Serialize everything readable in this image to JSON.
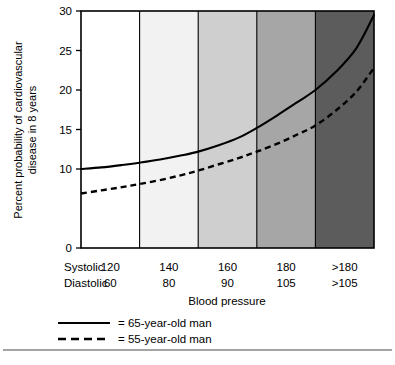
{
  "chart_data": {
    "type": "line",
    "title": "",
    "xlabel": "Blood pressure",
    "ylabel": "Percent probability of cardiovascular disease in 8 years",
    "ylabel_line1": "Percent probability of cardiovascular",
    "ylabel_line2": "disease in 8 years",
    "ylim": [
      0,
      30
    ],
    "yticks": [
      0,
      10,
      15,
      20,
      25,
      30
    ],
    "ytick_labels": [
      "0",
      "10",
      "15",
      "20",
      "25",
      "30"
    ],
    "grid": false,
    "legend_position": "below-axes",
    "x_axis_rows": [
      {
        "name": "Systolic",
        "values": [
          "120",
          "140",
          "160",
          "180",
          ">180"
        ]
      },
      {
        "name": "Diastolic",
        "values": [
          "60",
          "80",
          "90",
          "105",
          ">105"
        ]
      }
    ],
    "x_category_positions": [
      120,
      140,
      160,
      180,
      200
    ],
    "xlim": [
      110,
      210
    ],
    "bands": [
      {
        "index": 1,
        "x_start": 110,
        "x_end": 130,
        "fill": "#ffffff"
      },
      {
        "index": 2,
        "x_start": 130,
        "x_end": 150,
        "fill": "#f2f2f2"
      },
      {
        "index": 3,
        "x_start": 150,
        "x_end": 170,
        "fill": "#cfcfcf"
      },
      {
        "index": 4,
        "x_start": 170,
        "x_end": 190,
        "fill": "#a6a6a6"
      },
      {
        "index": 5,
        "x_start": 190,
        "x_end": 210,
        "fill": "#5c5c5c"
      }
    ],
    "series": [
      {
        "name": "65-year-old man",
        "style": "solid",
        "legend_label": "= 65-year-old man",
        "x": [
          110,
          117,
          124,
          130,
          137,
          144,
          150,
          157,
          164,
          170,
          177,
          184,
          190,
          197,
          204,
          210
        ],
        "values": [
          10.0,
          10.2,
          10.5,
          10.8,
          11.2,
          11.7,
          12.2,
          13.0,
          14.0,
          15.2,
          16.8,
          18.5,
          20.0,
          22.3,
          25.3,
          29.5
        ]
      },
      {
        "name": "55-year-old man",
        "style": "dashed",
        "legend_label": "= 55-year-old man",
        "x": [
          110,
          117,
          124,
          130,
          137,
          144,
          150,
          157,
          164,
          170,
          177,
          184,
          190,
          197,
          204,
          210
        ],
        "values": [
          6.9,
          7.3,
          7.7,
          8.1,
          8.6,
          9.2,
          9.8,
          10.6,
          11.4,
          12.2,
          13.2,
          14.4,
          15.5,
          17.4,
          19.8,
          22.8
        ]
      }
    ]
  },
  "legend": {
    "items": [
      {
        "label": "= 65-year-old man",
        "style": "solid"
      },
      {
        "label": "= 55-year-old man",
        "style": "dashed"
      }
    ]
  },
  "colors": {
    "ink": "#000000",
    "band_1": "#ffffff",
    "band_2": "#f2f2f2",
    "band_3": "#cfcfcf",
    "band_4": "#a6a6a6",
    "band_5": "#5c5c5c",
    "footer_rule": "#4a4a4a"
  }
}
